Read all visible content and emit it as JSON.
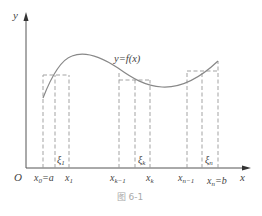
{
  "figure": {
    "caption": "图 6-1",
    "curve_label": "y=f(x)",
    "origin_label": "O",
    "x_axis_label": "x",
    "y_axis_label": "y",
    "x_ticks": [
      {
        "name": "x0",
        "text": "x",
        "sub": "0",
        "suffix": "=a"
      },
      {
        "name": "x1",
        "text": "x",
        "sub": "1",
        "suffix": ""
      },
      {
        "name": "xk-1",
        "text": "x",
        "sub": "k−1",
        "suffix": ""
      },
      {
        "name": "xk",
        "text": "x",
        "sub": "k",
        "suffix": ""
      },
      {
        "name": "xn-1",
        "text": "x",
        "sub": "n−1",
        "suffix": ""
      },
      {
        "name": "xn",
        "text": "x",
        "sub": "n",
        "suffix": "=b"
      }
    ],
    "sample_points": [
      {
        "name": "xi1",
        "text": "ξ",
        "sub": "1"
      },
      {
        "name": "xik",
        "text": "ξ",
        "sub": "k"
      },
      {
        "name": "xin",
        "text": "ξ",
        "sub": "n"
      }
    ],
    "colors": {
      "axis": "#555555",
      "curve": "#888888",
      "dashed": "#999999",
      "caption": "#aaaaaa"
    }
  }
}
